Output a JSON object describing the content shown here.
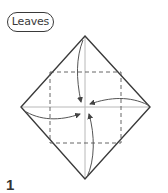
{
  "label": {
    "text": "Leaves"
  },
  "step": {
    "number": "1"
  },
  "diagram": {
    "type": "origami-fold",
    "colors": {
      "outline": "#3a3a3a",
      "crease": "#b5b5b5",
      "dashed": "#555555",
      "arrow": "#555555"
    }
  }
}
